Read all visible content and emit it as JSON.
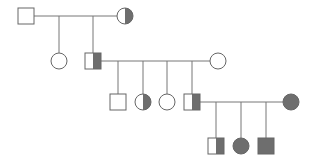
{
  "chart_data": {
    "type": "pedigree",
    "title": "",
    "colors": {
      "affected_fill": "#6e6e6e",
      "unaffected_fill": "#ffffff",
      "stroke": "#666666",
      "line": "#777777"
    },
    "legend": {
      "square": "male",
      "circle": "female",
      "filled": "affected",
      "half-filled": "carrier",
      "empty": "unaffected"
    },
    "generations": [
      {
        "id": "I",
        "individuals": [
          {
            "id": "I-1",
            "sex": "male",
            "status": "unaffected",
            "x": 26,
            "y": 16
          },
          {
            "id": "I-2",
            "sex": "female",
            "status": "carrier",
            "x": 125,
            "y": 16
          }
        ]
      },
      {
        "id": "II",
        "individuals": [
          {
            "id": "II-1",
            "sex": "female",
            "status": "unaffected",
            "x": 59,
            "y": 61
          },
          {
            "id": "II-2",
            "sex": "male",
            "status": "carrier",
            "x": 93,
            "y": 61
          },
          {
            "id": "II-3",
            "sex": "female",
            "status": "unaffected",
            "x": 218,
            "y": 61,
            "note": "spouse"
          }
        ]
      },
      {
        "id": "III",
        "individuals": [
          {
            "id": "III-1",
            "sex": "male",
            "status": "unaffected",
            "x": 118,
            "y": 102
          },
          {
            "id": "III-2",
            "sex": "female",
            "status": "carrier",
            "x": 143,
            "y": 102
          },
          {
            "id": "III-3",
            "sex": "female",
            "status": "unaffected",
            "x": 167,
            "y": 102
          },
          {
            "id": "III-4",
            "sex": "male",
            "status": "carrier",
            "x": 192,
            "y": 102
          },
          {
            "id": "III-5",
            "sex": "female",
            "status": "affected",
            "x": 291,
            "y": 102,
            "note": "spouse"
          }
        ]
      },
      {
        "id": "IV",
        "individuals": [
          {
            "id": "IV-1",
            "sex": "male",
            "status": "carrier",
            "x": 216,
            "y": 146
          },
          {
            "id": "IV-2",
            "sex": "female",
            "status": "affected",
            "x": 241,
            "y": 146
          },
          {
            "id": "IV-3",
            "sex": "male",
            "status": "affected",
            "x": 266,
            "y": 146
          }
        ]
      }
    ],
    "matings": [
      {
        "partners": [
          "I-1",
          "I-2"
        ],
        "children": [
          "II-1",
          "II-2"
        ]
      },
      {
        "partners": [
          "II-2",
          "II-3"
        ],
        "children": [
          "III-1",
          "III-2",
          "III-3",
          "III-4"
        ]
      },
      {
        "partners": [
          "III-4",
          "III-5"
        ],
        "children": [
          "IV-1",
          "IV-2",
          "IV-3"
        ]
      }
    ]
  }
}
